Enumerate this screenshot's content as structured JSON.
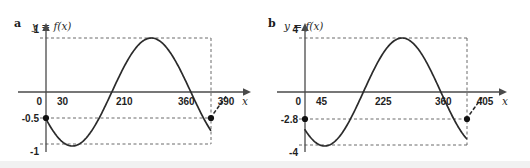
{
  "figure": {
    "panels": [
      {
        "id": "a",
        "letter": "a",
        "function_label": "y = f(x)",
        "x_axis_name": "x",
        "chart_data": {
          "type": "line",
          "title": "y = f(x)",
          "xlabel": "x",
          "ylabel": "y",
          "xlim": [
            -40,
            420
          ],
          "ylim": [
            -1.35,
            1.35
          ],
          "grid": false,
          "legend": "none",
          "x_ticks": [
            "0",
            "30",
            "210",
            "360",
            "390"
          ],
          "x_tick_values": [
            0,
            30,
            210,
            360,
            390
          ],
          "y_ticks": [
            "1",
            "0",
            "-0.5",
            "-1"
          ],
          "y_tick_values": [
            1,
            0,
            -0.5,
            -1
          ],
          "amplitude": 1,
          "period": 360,
          "start_point": {
            "x": 0,
            "y": -0.5,
            "label": "-0.5"
          },
          "end_point": {
            "x": 375,
            "y": -0.5,
            "label": "-0.5"
          },
          "maximum": {
            "x": 120,
            "y": 1
          },
          "minimum": {
            "x": 300,
            "y": -1
          },
          "zero_crossings": [
            30,
            210
          ],
          "guide_lines": [
            {
              "type": "horizontal",
              "value": 1
            },
            {
              "type": "horizontal",
              "value": -0.5
            },
            {
              "type": "horizontal",
              "value": -1
            },
            {
              "type": "vertical",
              "value": 375
            }
          ],
          "series": [
            {
              "name": "f(x)",
              "expression": "sin(x + 210)",
              "x": [
                0,
                15,
                30,
                45,
                60,
                75,
                90,
                105,
                120,
                135,
                150,
                165,
                180,
                195,
                210,
                225,
                240,
                255,
                270,
                285,
                300,
                315,
                330,
                345,
                360,
                375
              ],
              "values": [
                -0.5,
                -0.259,
                0,
                0.259,
                0.5,
                0.707,
                0.866,
                0.966,
                1.0,
                0.966,
                0.866,
                0.707,
                0.5,
                0.259,
                0,
                -0.259,
                -0.5,
                -0.707,
                -0.866,
                -0.966,
                -1.0,
                -0.966,
                -0.866,
                -0.707,
                -0.5,
                -0.5
              ]
            }
          ]
        }
      },
      {
        "id": "b",
        "letter": "b",
        "function_label": "y = f(x)",
        "x_axis_name": "x",
        "chart_data": {
          "type": "line",
          "title": "y = f(x)",
          "xlabel": "x",
          "ylabel": "y",
          "xlim": [
            -40,
            435
          ],
          "ylim": [
            -5.4,
            5.4
          ],
          "grid": false,
          "legend": "none",
          "x_ticks": [
            "0",
            "45",
            "225",
            "360",
            "405"
          ],
          "x_tick_values": [
            0,
            45,
            225,
            360,
            405
          ],
          "y_ticks": [
            "4",
            "0",
            "-2.8",
            "-4"
          ],
          "y_tick_values": [
            4,
            0,
            -2.8,
            -4
          ],
          "amplitude": 4,
          "period": 360,
          "start_point": {
            "x": 0,
            "y": -2.8,
            "label": "-2.8"
          },
          "end_point": {
            "x": 375,
            "y": -2.8,
            "label": "-2.8"
          },
          "maximum": {
            "x": 135,
            "y": 4
          },
          "minimum": {
            "x": 315,
            "y": -4
          },
          "zero_crossings": [
            45,
            225
          ],
          "guide_lines": [
            {
              "type": "horizontal",
              "value": 4
            },
            {
              "type": "horizontal",
              "value": -2.8
            },
            {
              "type": "horizontal",
              "value": -4
            },
            {
              "type": "vertical",
              "value": 375
            }
          ],
          "series": [
            {
              "name": "f(x)",
              "expression": "4 sin(x + 225)",
              "x": [
                0,
                15,
                45,
                75,
                105,
                135,
                165,
                195,
                225,
                255,
                285,
                315,
                345,
                360,
                375
              ],
              "values": [
                -2.83,
                -2.0,
                0,
                2.0,
                3.46,
                4.0,
                3.46,
                2.0,
                0,
                -2.0,
                -3.46,
                -4.0,
                -3.46,
                -2.83,
                -2.83
              ]
            }
          ]
        }
      }
    ],
    "colors": {
      "curve": "#2b2b2b",
      "axis": "#4a4a4a",
      "guide": "#5a5a5a",
      "point": "#111111",
      "text": "#1f1f1f",
      "background": "#ffffff",
      "band": "#f1f1f1"
    }
  }
}
